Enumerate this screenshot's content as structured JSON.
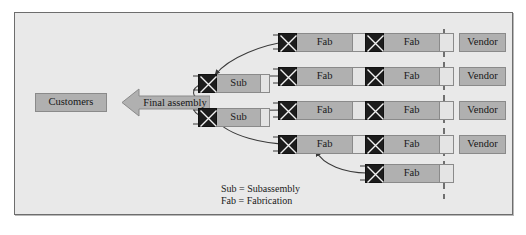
{
  "diagram": {
    "colors": {
      "panel_background": "#e9e9e9",
      "panel_border": "#6d6d6d",
      "box_fill": "#b0b0b0",
      "box_border": "#8a8a8a",
      "queue_fill": "#e4e4e4",
      "machine_fill": "#1c1c1c",
      "connector": "#3a3a3a",
      "text": "#161616"
    }
  },
  "customers": {
    "label": "Customers"
  },
  "final_assembly": {
    "label": "Final assembly"
  },
  "subassemblies": [
    {
      "label": "Sub"
    },
    {
      "label": "Sub"
    }
  ],
  "fabrication_rows": [
    {
      "stages": [
        {
          "label": "Fab"
        },
        {
          "label": "Fab"
        }
      ],
      "vendor": "Vendor"
    },
    {
      "stages": [
        {
          "label": "Fab"
        },
        {
          "label": "Fab"
        }
      ],
      "vendor": "Vendor"
    },
    {
      "stages": [
        {
          "label": "Fab"
        },
        {
          "label": "Fab"
        }
      ],
      "vendor": "Vendor"
    },
    {
      "stages": [
        {
          "label": "Fab"
        },
        {
          "label": "Fab"
        }
      ],
      "vendor": "Vendor"
    },
    {
      "stages": [
        {
          "label": "Fab"
        }
      ],
      "vendor": ""
    }
  ],
  "vendors": [
    {
      "label": "Vendor"
    },
    {
      "label": "Vendor"
    },
    {
      "label": "Vendor"
    },
    {
      "label": "Vendor"
    }
  ],
  "legend": {
    "line1": "Sub = Subassembly",
    "line2": "Fab = Fabrication"
  }
}
